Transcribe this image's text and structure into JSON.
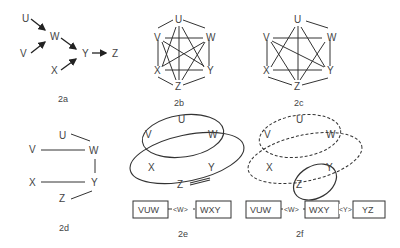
{
  "figures": {
    "a": {
      "caption": "2a",
      "nodes": [
        "U",
        "V",
        "W",
        "X",
        "Y",
        "Z"
      ]
    },
    "b": {
      "caption": "2b",
      "nodes": [
        "U",
        "V",
        "W",
        "X",
        "Y",
        "Z"
      ]
    },
    "c": {
      "caption": "2c",
      "nodes": [
        "U",
        "V",
        "W",
        "X",
        "Y",
        "Z"
      ]
    },
    "d": {
      "caption": "2d",
      "nodes": [
        "U",
        "V",
        "W",
        "X",
        "Y",
        "Z"
      ]
    },
    "e": {
      "caption": "2e",
      "nodes": [
        "U",
        "V",
        "W",
        "X",
        "Y",
        "Z"
      ],
      "clique1": "VUW",
      "sep1": "<W>",
      "clique2": "WXY"
    },
    "f": {
      "caption": "2f",
      "nodes": [
        "U",
        "V",
        "W",
        "X",
        "Y",
        "Z"
      ],
      "clique1": "VUW",
      "sep1": "<W>",
      "clique2": "WXY",
      "sep2": "<Y>",
      "clique3": "YZ"
    }
  }
}
